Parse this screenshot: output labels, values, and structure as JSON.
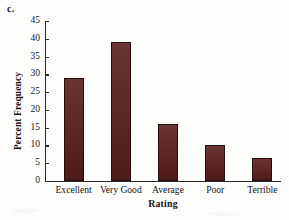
{
  "figure": {
    "panel_letter": "c.",
    "background_color": "#fdfdfb",
    "bar_color": "#571d1d",
    "axis_color": "#2a2a2a"
  },
  "chart_data": {
    "type": "bar",
    "title": "",
    "categories": [
      "Excellent",
      "Very Good",
      "Average",
      "Poor",
      "Terrible"
    ],
    "values": [
      29,
      39,
      16,
      10,
      6.5
    ],
    "xlabel": "Rating",
    "ylabel": "Percent Frequency",
    "ylim": [
      0,
      45
    ],
    "yticks": [
      0,
      5,
      10,
      15,
      20,
      25,
      30,
      35,
      40,
      45
    ],
    "ytick_labels": [
      "0",
      "5",
      "10",
      "15",
      "20",
      "25",
      "30",
      "35",
      "40",
      "45"
    ],
    "grid": false,
    "legend": false,
    "legend_position": "none"
  }
}
